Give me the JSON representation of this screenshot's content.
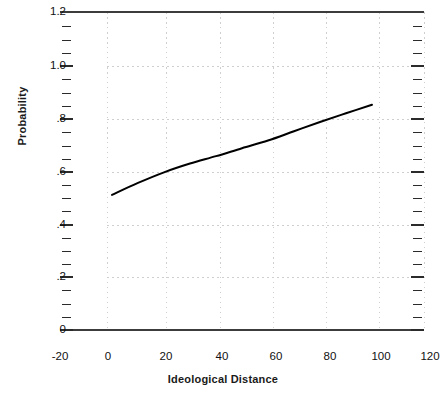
{
  "chart_data": {
    "type": "line",
    "title": "",
    "xlabel": "Ideological Distance",
    "ylabel": "Probability",
    "xlim": [
      -20,
      120
    ],
    "ylim": [
      0,
      1.2
    ],
    "grid": true,
    "legend": "none",
    "x_ticks": [
      "-20",
      "0",
      "20",
      "40",
      "60",
      "80",
      "100",
      "120"
    ],
    "x_tick_values": [
      -20,
      0,
      20,
      40,
      60,
      80,
      100,
      120
    ],
    "y_ticks": [
      "0",
      ".2",
      ".4",
      ".6",
      ".8",
      "1.0",
      "1.2"
    ],
    "y_tick_values": [
      0,
      0.2,
      0.4,
      0.6,
      0.8,
      1.0,
      1.2
    ],
    "series": [
      {
        "name": "Predicted probability",
        "color": "#000000",
        "x": [
          0,
          10,
          20,
          30,
          40,
          50,
          60,
          70,
          80,
          90,
          100
        ],
        "values": [
          0.51,
          0.555,
          0.595,
          0.628,
          0.656,
          0.686,
          0.715,
          0.75,
          0.785,
          0.818,
          0.85
        ]
      }
    ]
  },
  "axes": {
    "frame_color": "#3c3c3c",
    "grid_color": "#cfcfcf",
    "tick_color": "#2b2b2b"
  }
}
